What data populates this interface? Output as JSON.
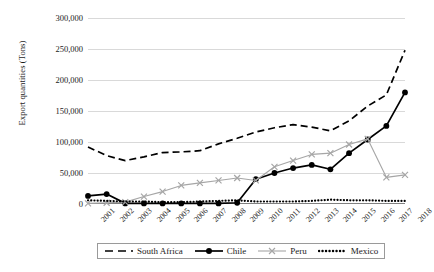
{
  "chart_data": {
    "type": "line",
    "title": "",
    "xlabel": "",
    "ylabel": "Export quantities (Tons)",
    "x": [
      2001,
      2002,
      2003,
      2004,
      2005,
      2006,
      2007,
      2008,
      2009,
      2010,
      2011,
      2012,
      2013,
      2014,
      2015,
      2016,
      2017,
      2018
    ],
    "categories": [
      "2001",
      "2002",
      "2003",
      "2004",
      "2005",
      "2006",
      "2007",
      "2008",
      "2009",
      "2010",
      "2011",
      "2012",
      "2013",
      "2014",
      "2015",
      "2016",
      "2017",
      "2018"
    ],
    "ylim": [
      0,
      300000
    ],
    "yticks": [
      0,
      50000,
      100000,
      150000,
      200000,
      250000,
      300000
    ],
    "ytick_labels": [
      "0",
      "50,000",
      "100,000",
      "150,000",
      "200,000",
      "250,000",
      "300,000"
    ],
    "grid": true,
    "legend_position": "bottom",
    "series": [
      {
        "name": "South Africa",
        "style": "dashed",
        "color": "#000000",
        "marker": "none",
        "values": [
          92000,
          78000,
          70000,
          76000,
          83000,
          84000,
          86000,
          97000,
          106000,
          116000,
          123000,
          128000,
          124000,
          118000,
          134000,
          158000,
          176000,
          248000
        ]
      },
      {
        "name": "Chile",
        "style": "solid",
        "color": "#000000",
        "marker": "circle",
        "values": [
          13000,
          16000,
          1000,
          1000,
          1000,
          1000,
          1000,
          1000,
          2000,
          40000,
          50000,
          58000,
          63000,
          56000,
          82000,
          104000,
          126000,
          180000
        ]
      },
      {
        "name": "Peru",
        "style": "solid",
        "color": "#a6a6a6",
        "marker": "x",
        "values": [
          1000,
          2000,
          3000,
          12000,
          20000,
          30000,
          34000,
          38000,
          42000,
          38000,
          60000,
          70000,
          80000,
          82000,
          96000,
          105000,
          43000,
          47000
        ]
      },
      {
        "name": "Mexico",
        "style": "dotted",
        "color": "#000000",
        "marker": "none",
        "values": [
          6000,
          5000,
          4000,
          4000,
          3000,
          3000,
          4000,
          5000,
          6000,
          4000,
          4000,
          4000,
          5000,
          7000,
          6000,
          6000,
          5000,
          5000
        ]
      }
    ]
  },
  "legend": {
    "items": [
      {
        "label": "South Africa"
      },
      {
        "label": "Chile"
      },
      {
        "label": "Peru"
      },
      {
        "label": "Mexico"
      }
    ]
  }
}
